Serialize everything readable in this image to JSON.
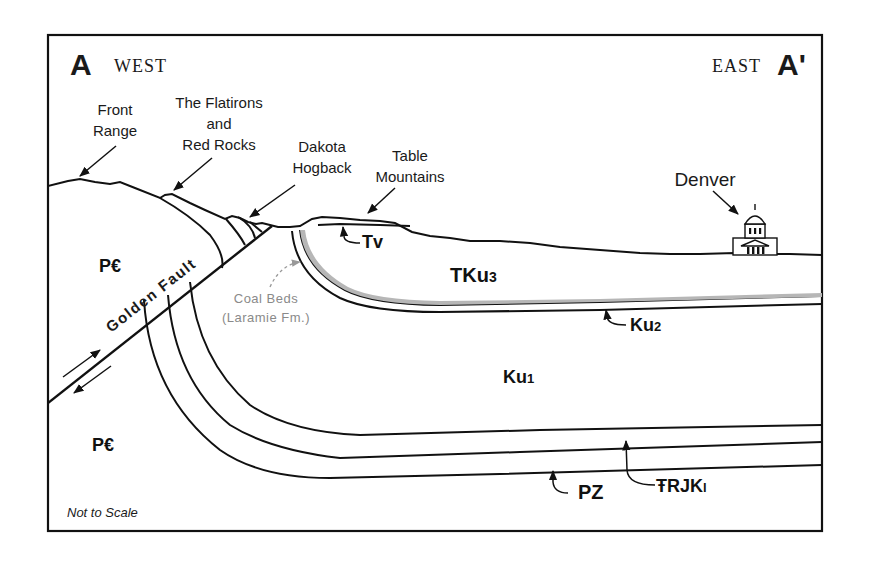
{
  "section": {
    "start_letter": "A",
    "start_direction": "WEST",
    "end_letter": "A'",
    "end_direction": "EAST",
    "scale_note": "Not to Scale"
  },
  "landmarks": {
    "front_range": [
      "Front",
      "Range"
    ],
    "flatirons": [
      "The Flatirons",
      "and",
      "Red Rocks"
    ],
    "dakota": [
      "Dakota",
      "Hogback"
    ],
    "table_mountains": [
      "Table",
      "Mountains"
    ],
    "denver": "Denver"
  },
  "fault": {
    "label": "Golden Fault"
  },
  "units": {
    "pc_upper": "P€",
    "pc_lower": "P€",
    "tv": "Tv",
    "tku3": {
      "base": "TKu",
      "sub": "3"
    },
    "ku2": {
      "base": "Ku",
      "sub": "2"
    },
    "ku1": {
      "base": "Ku",
      "sub": "1"
    },
    "pz": "PZ",
    "trjkl": {
      "base": "ŦRJK",
      "sub": "l"
    }
  },
  "coal": {
    "line1": "Coal Beds",
    "line2": "(Laramie Fm.)"
  },
  "colors": {
    "ink": "#111111",
    "coal_gray": "#8a8a8a",
    "coal_hatch": "#a8a8a8",
    "background": "#ffffff"
  }
}
